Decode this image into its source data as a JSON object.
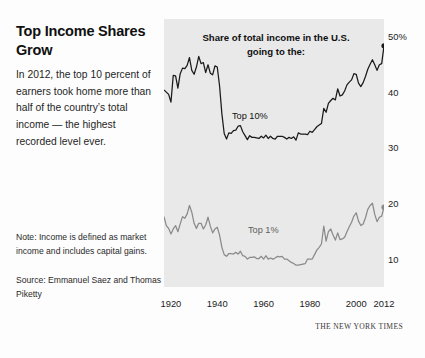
{
  "article": {
    "headline": "Top Income Shares Grow",
    "deck": "In 2012, the top 10 percent of earners took home more than half of the country’s total income — the highest recorded level ever.",
    "note": "Note: Income is defined as market income and includes capital gains.",
    "source": "Source: Emmanuel Saez and Thomas Piketty",
    "credit": "THE NEW YORK TIMES"
  },
  "chart_data": {
    "type": "line",
    "title": "Share of total income in the U.S. going to the:",
    "xlabel": "",
    "ylabel": "",
    "xlim": [
      1917,
      2012
    ],
    "ylim": [
      5,
      53
    ],
    "grid": false,
    "legend_position": "inline-annotations",
    "xticks": [
      1920,
      1940,
      1960,
      1980,
      2000,
      2012
    ],
    "xticklabels": [
      "1920",
      "1940",
      "1960",
      "1980",
      "2000",
      "2012"
    ],
    "yticks": [
      10,
      20,
      30,
      40,
      50
    ],
    "yticklabels": [
      "10",
      "20",
      "30",
      "40",
      "50%"
    ],
    "colors": {
      "top10": "#1a1a1a",
      "top1": "#8a8a8a",
      "panel": "#e9e9e9"
    },
    "series": [
      {
        "name": "Top 10%",
        "color": "#1a1a1a",
        "end_marker": true,
        "x": [
          1917,
          1918,
          1919,
          1920,
          1921,
          1922,
          1923,
          1924,
          1925,
          1926,
          1927,
          1928,
          1929,
          1930,
          1931,
          1932,
          1933,
          1934,
          1935,
          1936,
          1937,
          1938,
          1939,
          1940,
          1941,
          1942,
          1943,
          1944,
          1945,
          1946,
          1947,
          1948,
          1949,
          1950,
          1951,
          1952,
          1953,
          1954,
          1955,
          1956,
          1957,
          1958,
          1959,
          1960,
          1961,
          1962,
          1963,
          1964,
          1965,
          1966,
          1967,
          1968,
          1969,
          1970,
          1971,
          1972,
          1973,
          1974,
          1975,
          1976,
          1977,
          1978,
          1979,
          1980,
          1981,
          1982,
          1983,
          1984,
          1985,
          1986,
          1987,
          1988,
          1989,
          1990,
          1991,
          1992,
          1993,
          1994,
          1995,
          1996,
          1997,
          1998,
          1999,
          2000,
          2001,
          2002,
          2003,
          2004,
          2005,
          2006,
          2007,
          2008,
          2009,
          2010,
          2011,
          2012
        ],
        "values": [
          40.3,
          39.9,
          39.5,
          38.1,
          42.9,
          42.8,
          40.6,
          43.2,
          44.2,
          44.1,
          44.7,
          46.1,
          43.8,
          43.1,
          44.4,
          46.3,
          45.0,
          45.2,
          43.4,
          44.8,
          43.3,
          43.0,
          44.6,
          44.4,
          41.0,
          36.0,
          32.5,
          31.5,
          32.6,
          32.5,
          33.0,
          33.1,
          33.8,
          33.9,
          32.8,
          32.1,
          31.4,
          32.1,
          31.8,
          31.8,
          31.7,
          31.6,
          32.0,
          31.7,
          32.2,
          31.6,
          32.0,
          31.6,
          31.5,
          32.0,
          32.0,
          32.0,
          31.8,
          31.5,
          31.8,
          31.6,
          31.9,
          31.3,
          32.6,
          32.4,
          32.4,
          32.4,
          32.3,
          32.9,
          32.7,
          33.2,
          33.7,
          34.0,
          34.3,
          37.0,
          36.3,
          37.9,
          38.4,
          38.8,
          38.5,
          40.5,
          39.2,
          39.4,
          40.1,
          41.2,
          41.7,
          42.1,
          43.2,
          43.1,
          41.5,
          40.9,
          41.6,
          42.7,
          44.0,
          44.9,
          45.7,
          44.8,
          43.8,
          44.8,
          45.0,
          48.2
        ]
      },
      {
        "name": "Top 1%",
        "color": "#8a8a8a",
        "end_marker": true,
        "x": [
          1917,
          1918,
          1919,
          1920,
          1921,
          1922,
          1923,
          1924,
          1925,
          1926,
          1927,
          1928,
          1929,
          1930,
          1931,
          1932,
          1933,
          1934,
          1935,
          1936,
          1937,
          1938,
          1939,
          1940,
          1941,
          1942,
          1943,
          1944,
          1945,
          1946,
          1947,
          1948,
          1949,
          1950,
          1951,
          1952,
          1953,
          1954,
          1955,
          1956,
          1957,
          1958,
          1959,
          1960,
          1961,
          1962,
          1963,
          1964,
          1965,
          1966,
          1967,
          1968,
          1969,
          1970,
          1971,
          1972,
          1973,
          1974,
          1975,
          1976,
          1977,
          1978,
          1979,
          1980,
          1981,
          1982,
          1983,
          1984,
          1985,
          1986,
          1987,
          1988,
          1989,
          1990,
          1991,
          1992,
          1993,
          1994,
          1995,
          1996,
          1997,
          1998,
          1999,
          2000,
          2001,
          2002,
          2003,
          2004,
          2005,
          2006,
          2007,
          2008,
          2009,
          2010,
          2011,
          2012
        ],
        "values": [
          17.6,
          16.0,
          15.5,
          14.5,
          15.4,
          16.0,
          14.9,
          16.3,
          17.6,
          17.3,
          18.1,
          19.6,
          18.4,
          16.4,
          15.5,
          16.4,
          16.4,
          15.4,
          16.1,
          17.5,
          15.9,
          14.7,
          15.4,
          15.7,
          14.3,
          12.1,
          10.8,
          10.5,
          11.0,
          11.0,
          10.9,
          11.2,
          10.9,
          11.4,
          10.6,
          10.5,
          10.0,
          10.3,
          10.3,
          10.4,
          10.1,
          10.1,
          10.5,
          10.0,
          10.6,
          10.0,
          10.2,
          10.0,
          10.2,
          10.5,
          10.4,
          10.5,
          10.0,
          10.0,
          9.7,
          9.4,
          9.2,
          8.9,
          8.9,
          9.0,
          9.1,
          9.2,
          10.0,
          10.0,
          10.0,
          10.8,
          11.6,
          12.1,
          12.7,
          15.9,
          13.2,
          14.9,
          15.4,
          14.3,
          13.4,
          14.7,
          13.5,
          13.6,
          13.9,
          14.9,
          15.8,
          16.6,
          17.7,
          18.3,
          16.8,
          16.0,
          16.3,
          17.4,
          18.9,
          19.6,
          20.0,
          18.0,
          16.7,
          17.5,
          17.7,
          19.3
        ]
      }
    ],
    "annotations": [
      {
        "text": "Top 10%",
        "series": "Top 10%"
      },
      {
        "text": "Top 1%",
        "series": "Top 1%"
      }
    ]
  }
}
